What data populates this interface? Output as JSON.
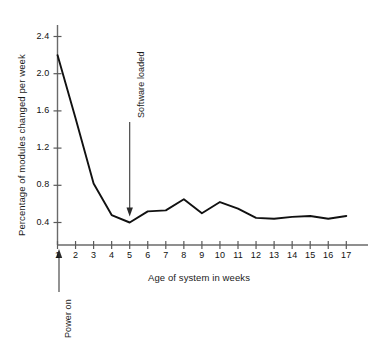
{
  "chart_data": {
    "type": "line",
    "title": "",
    "xlabel": "Age of system in weeks",
    "ylabel": "Percentage of modules changed per week",
    "xlim": [
      1,
      17
    ],
    "ylim": [
      0.2,
      2.6
    ],
    "xticks": [
      "1",
      "2",
      "3",
      "4",
      "5",
      "6",
      "7",
      "8",
      "9",
      "10",
      "11",
      "12",
      "13",
      "14",
      "15",
      "16",
      "17"
    ],
    "yticks": [
      "0.4",
      "0.8",
      "1.2",
      "1.6",
      "2.0",
      "2.4"
    ],
    "grid": false,
    "legend": "none",
    "x": [
      1,
      2,
      3,
      4,
      5,
      6,
      7,
      8,
      9,
      10,
      11,
      12,
      13,
      14,
      15,
      16,
      17
    ],
    "values": [
      2.2,
      1.52,
      0.82,
      0.48,
      0.4,
      0.52,
      0.53,
      0.65,
      0.5,
      0.62,
      0.55,
      0.45,
      0.44,
      0.46,
      0.47,
      0.44,
      0.47
    ],
    "series": [
      {
        "name": "Percentage of modules changed per week",
        "values": [
          2.2,
          1.52,
          0.82,
          0.48,
          0.4,
          0.52,
          0.53,
          0.65,
          0.5,
          0.62,
          0.55,
          0.45,
          0.44,
          0.46,
          0.47,
          0.44,
          0.47
        ],
        "color": "#111111"
      }
    ],
    "annotations": [
      {
        "id": "power-on",
        "text": "Power on",
        "at_x": 1,
        "orientation": "vertical",
        "arrow": "up",
        "placement": "below-axis"
      },
      {
        "id": "software-loaded",
        "text": "Software loaded",
        "at_x": 5,
        "orientation": "vertical",
        "arrow": "down",
        "placement": "in-plot"
      }
    ]
  },
  "axes": {
    "y_axis_label": "Percentage of modules changed per week",
    "x_axis_label": "Age of system in weeks",
    "y_tick_labels": [
      "2.4",
      "2.0",
      "1.6",
      "1.2",
      "0.8",
      "0.4"
    ],
    "x_tick_labels": [
      "1",
      "2",
      "3",
      "4",
      "5",
      "6",
      "7",
      "8",
      "9",
      "10",
      "11",
      "12",
      "13",
      "14",
      "15",
      "16",
      "17"
    ]
  },
  "annotations": {
    "power_on": "Power on",
    "software_loaded": "Software loaded"
  },
  "colors": {
    "line": "#111111",
    "axis": "#555555",
    "text": "#111111",
    "background": "#ffffff"
  }
}
